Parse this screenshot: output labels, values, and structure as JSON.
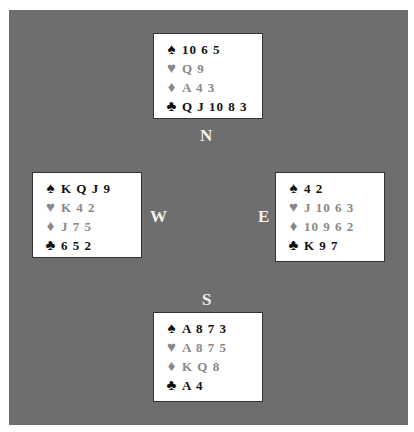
{
  "colors": {
    "panel": "#6e6e6e",
    "black_suit": "#111111",
    "red_suit": "#888888",
    "seat_label": "#f2f2f2"
  },
  "seats": {
    "north": "N",
    "south": "S",
    "east": "E",
    "west": "W"
  },
  "suits": {
    "spades": "♠",
    "hearts": "♥",
    "diamonds": "♦",
    "clubs": "♣"
  },
  "hands": {
    "north": {
      "spades": "10 6 5",
      "hearts": "Q 9",
      "diamonds": "A 4 3",
      "clubs": "Q J 10 8 3"
    },
    "west": {
      "spades": "K Q J 9",
      "hearts": "K 4 2",
      "diamonds": "J 7 5",
      "clubs": "6 5 2"
    },
    "east": {
      "spades": "4 2",
      "hearts": "J 10 6 3",
      "diamonds": "10 9 6 2",
      "clubs": "K 9 7"
    },
    "south": {
      "spades": "A 8 7 3",
      "hearts": "A 8 7 5",
      "diamonds": "K Q 8",
      "clubs": "A 4"
    }
  }
}
